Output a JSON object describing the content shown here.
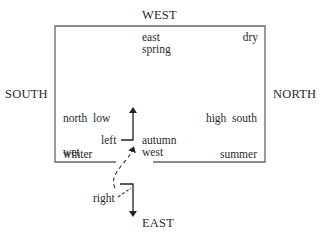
{
  "compass": {
    "top": "WEST",
    "left": "SOUTH",
    "right": "NORTH",
    "bottom": "EAST"
  },
  "quadrants": {
    "top_center": [
      "east",
      "spring"
    ],
    "top_right": [
      "dry"
    ],
    "mid_left": [
      "north  low",
      "winter"
    ],
    "mid_right": [
      "high  south",
      "summer"
    ],
    "bottom_left": [
      "wet"
    ],
    "bottom_center": [
      "autumn",
      "west"
    ]
  },
  "arrows": {
    "upper_label": "left",
    "lower_label": "right"
  },
  "colors": {
    "line": "#333333",
    "box": "#555555",
    "text": "#2a2a2a"
  }
}
